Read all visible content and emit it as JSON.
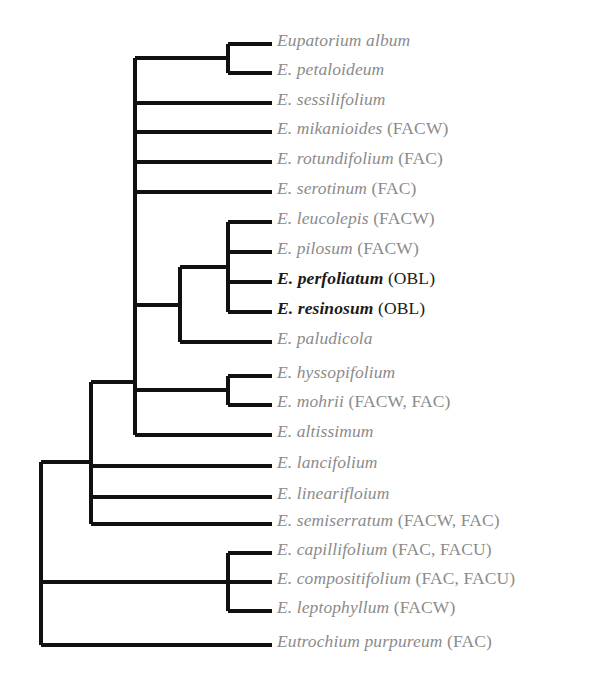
{
  "figure": {
    "type": "cladogram",
    "orientation": "left-to-right",
    "line_color": "#111111",
    "label_color": "#8b8b8b",
    "highlight_color": "#1a1a1a",
    "background": "#ffffff"
  },
  "tips": [
    {
      "name": "Eupatorium album",
      "code": "",
      "highlight": false,
      "y": 44
    },
    {
      "name": "E. petaloideum",
      "code": "",
      "highlight": false,
      "y": 73
    },
    {
      "name": "E. sessilifolium",
      "code": "",
      "highlight": false,
      "y": 103
    },
    {
      "name": "E. mikanioides",
      "code": "(FACW)",
      "highlight": false,
      "y": 132
    },
    {
      "name": "E. rotundifolium",
      "code": "(FAC)",
      "highlight": false,
      "y": 162
    },
    {
      "name": "E. serotinum",
      "code": "(FAC)",
      "highlight": false,
      "y": 192
    },
    {
      "name": "E. leucolepis",
      "code": "(FACW)",
      "highlight": false,
      "y": 222
    },
    {
      "name": "E. pilosum",
      "code": "(FACW)",
      "highlight": false,
      "y": 252
    },
    {
      "name": "E. perfoliatum",
      "code": "(OBL)",
      "highlight": true,
      "y": 282
    },
    {
      "name": "E. resinosum",
      "code": "(OBL)",
      "highlight": true,
      "y": 312
    },
    {
      "name": "E. paludicola",
      "code": "",
      "highlight": false,
      "y": 342
    },
    {
      "name": "E. hyssopifolium",
      "code": "",
      "highlight": false,
      "y": 376
    },
    {
      "name": "E. mohrii",
      "code": "(FACW, FAC)",
      "highlight": false,
      "y": 405
    },
    {
      "name": "E. altissimum",
      "code": "",
      "highlight": false,
      "y": 435
    },
    {
      "name": "E. lancifolium",
      "code": "",
      "highlight": false,
      "y": 466
    },
    {
      "name": "E. linearifloium",
      "code": "",
      "highlight": false,
      "y": 497
    },
    {
      "name": "E. semiserratum",
      "code": "(FACW, FAC)",
      "highlight": false,
      "y": 524
    },
    {
      "name": "E. capillifolium",
      "code": "(FAC, FACU)",
      "highlight": false,
      "y": 553
    },
    {
      "name": "E. compositifolium",
      "code": "(FAC, FACU)",
      "highlight": false,
      "y": 582
    },
    {
      "name": "E. leptophyllum",
      "code": "(FACW)",
      "highlight": false,
      "y": 611
    },
    {
      "name": "Eutrochium purpureum",
      "code": "(FAC)",
      "highlight": false,
      "y": 645
    }
  ]
}
